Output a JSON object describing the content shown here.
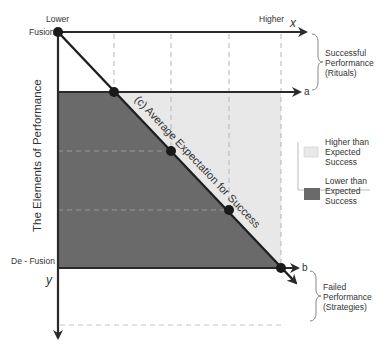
{
  "diagram": {
    "axis_x": {
      "label": "x",
      "start_label": "Lower",
      "end_label": "Higher"
    },
    "axis_y": {
      "label": "y",
      "title": "The Elements of Performance",
      "top_label": "Fusion",
      "bottom_label": "De - Fusion"
    },
    "line_a_label": "a",
    "line_b_label": "b",
    "diagonal_label": "(c) Average Expectation for Success",
    "brace_top": {
      "line1": "Successful",
      "line2": "Performance",
      "line3": "(Rituals)"
    },
    "brace_bottom": {
      "line1": "Failed",
      "line2": "Performance",
      "line3": "(Strategies)"
    },
    "legend": {
      "items": [
        {
          "line1": "Higher than",
          "line2": "Expected",
          "line3": "Success",
          "color": "#e8e8e8"
        },
        {
          "line1": "Lower than",
          "line2": "Expected",
          "line3": "Success",
          "color": "#6a6a6a"
        }
      ]
    },
    "colors": {
      "higher_region": "#e8e8e8",
      "lower_region": "#6a6a6a",
      "axis": "#2a2a2a",
      "dash": "#b5b5b5"
    }
  }
}
